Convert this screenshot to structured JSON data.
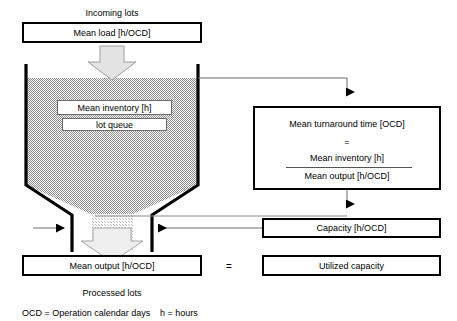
{
  "diagram": {
    "top_caption": "Incoming lots",
    "bottom_caption": "Processed lots",
    "equals_sign": "=",
    "boxes": {
      "mean_load": "Mean load [h/OCD]",
      "mean_inventory": "Mean inventory [h]",
      "lot_queue": "lot queue",
      "mean_output": "Mean output [h/OCD]",
      "capacity": "Capacity [h/OCD]",
      "utilized_capacity": "Utilized capacity"
    },
    "formula": {
      "heading": "Mean turnaround time [OCD]",
      "equals": "=",
      "numerator": "Mean inventory [h]",
      "denominator": "Mean output [h/OCD]"
    },
    "legend": {
      "ocd": "OCD = Operation calendar days",
      "h": "h = hours"
    },
    "colors": {
      "stroke": "#000000",
      "hatch_fill": "#9a9a9a",
      "arrow_fill": "#d9d9d9",
      "thin_line": "#6b6b6b",
      "background": "#ffffff"
    }
  }
}
